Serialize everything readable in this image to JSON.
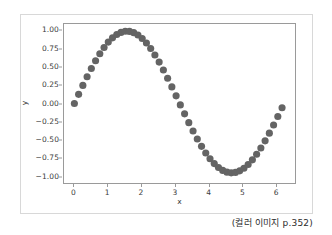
{
  "figure": {
    "background_color": "#ffffff",
    "frame_color": "#d8d8d8",
    "axes_edge_color": "#9a9a9a"
  },
  "caption": {
    "text": "(컬러 이미지 p.352)"
  },
  "chart_data": {
    "type": "scatter",
    "title": "",
    "xlabel": "x",
    "ylabel": "y",
    "marker_color": "#646464",
    "marker_size_px": 3.6,
    "grid": false,
    "legend": null,
    "xlim": [
      -0.31,
      6.59
    ],
    "ylim": [
      -1.1,
      1.1
    ],
    "xticks": [
      0,
      1,
      2,
      3,
      4,
      5,
      6
    ],
    "xtick_labels": [
      "0",
      "1",
      "2",
      "3",
      "4",
      "5",
      "6"
    ],
    "yticks": [
      -1.0,
      -0.75,
      -0.5,
      -0.25,
      0.0,
      0.25,
      0.5,
      0.75,
      1.0
    ],
    "ytick_labels": [
      "-1.00",
      "-0.75",
      "-0.50",
      "-0.25",
      "0.00",
      "0.25",
      "0.50",
      "0.75",
      "1.00"
    ],
    "series": [
      {
        "name": "sin(x)",
        "x": [
          0.0,
          0.1266,
          0.2532,
          0.3798,
          0.5064,
          0.633,
          0.7596,
          0.8862,
          1.0128,
          1.1394,
          1.266,
          1.3926,
          1.5192,
          1.6458,
          1.7724,
          1.899,
          2.0256,
          2.1522,
          2.2788,
          2.4054,
          2.532,
          2.6586,
          2.7852,
          2.9118,
          3.0384,
          3.165,
          3.2916,
          3.4182,
          3.5448,
          3.6714,
          3.798,
          3.9246,
          4.0512,
          4.1778,
          4.3044,
          4.431,
          4.5576,
          4.6842,
          4.8108,
          4.9374,
          5.064,
          5.1906,
          5.3172,
          5.4438,
          5.5704,
          5.697,
          5.8236,
          5.9502,
          6.0768,
          6.2034
        ],
        "y": [
          0.0,
          0.1263,
          0.2505,
          0.3708,
          0.4848,
          0.5915,
          0.6889,
          0.7754,
          0.8497,
          0.9086,
          0.9538,
          0.9836,
          0.9988,
          0.9975,
          0.9804,
          0.9481,
          0.8992,
          0.8367,
          0.7604,
          0.6714,
          0.5725,
          0.4645,
          0.3496,
          0.2294,
          0.1057,
          -0.0192,
          -0.1435,
          -0.2648,
          -0.3813,
          -0.4912,
          -0.5926,
          -0.6841,
          -0.7642,
          -0.8318,
          -0.8858,
          -0.9254,
          -0.9501,
          -0.9594,
          -0.9533,
          -0.9318,
          -0.8953,
          -0.8444,
          -0.78,
          -0.7031,
          -0.6149,
          -0.5168,
          -0.4105,
          -0.2975,
          -0.1796,
          -0.0587
        ]
      }
    ]
  }
}
